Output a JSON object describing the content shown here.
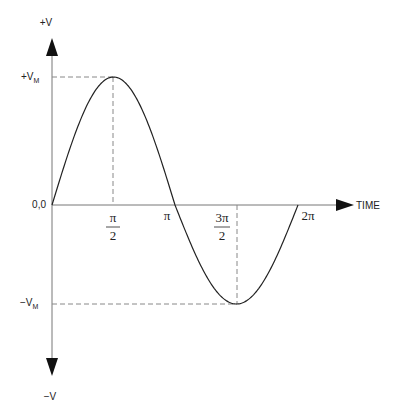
{
  "chart_data": {
    "type": "line",
    "title": "",
    "xlabel": "TIME",
    "ylabel_top": "+V",
    "ylabel_bottom": "−V",
    "origin_label": "0,0",
    "y_ticks": {
      "peak": "+V",
      "peak_sub": "M",
      "trough": "−V",
      "trough_sub": "M"
    },
    "x_ticks": [
      {
        "num": "π",
        "den": "2"
      },
      {
        "label": "π"
      },
      {
        "num": "3π",
        "den": "2"
      },
      {
        "label": "2π"
      }
    ],
    "x": [
      0,
      0.7854,
      1.5708,
      2.3562,
      3.1416,
      3.927,
      4.7124,
      5.4978,
      6.2832
    ],
    "series": [
      {
        "name": "sine wave",
        "values": [
          0,
          0.707,
          1,
          0.707,
          0,
          -0.707,
          -1,
          -0.707,
          0
        ]
      }
    ],
    "ylim": [
      -1,
      1
    ],
    "grid": false
  }
}
